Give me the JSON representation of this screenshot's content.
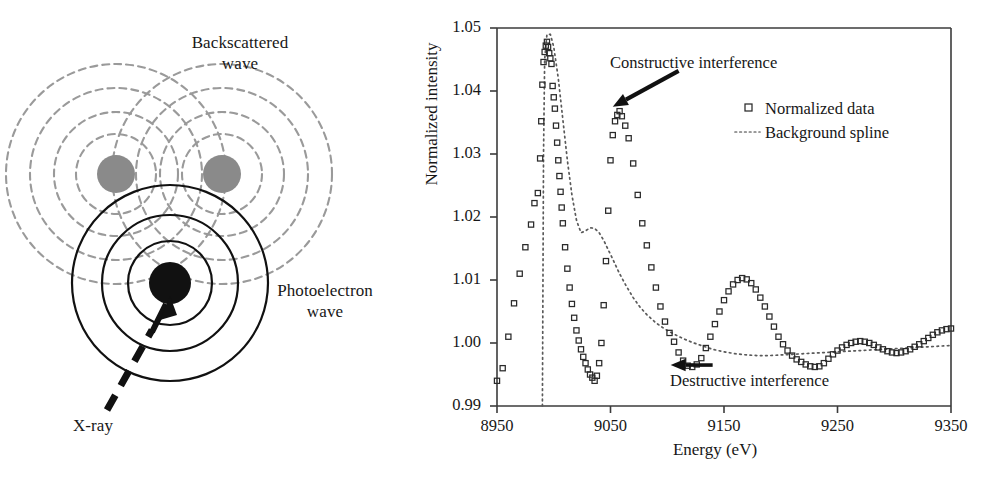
{
  "figure": {
    "diagram": {
      "labels": {
        "backscattered": "Backscattered\nwave",
        "backscattered_line1": "Backscattered",
        "backscattered_line2": "wave",
        "photoelectron_line1": "Photoelectron",
        "photoelectron_line2": "wave",
        "xray": "X-ray"
      },
      "colors": {
        "absorber_atom": "#111111",
        "scatterer_atom": "#8a8a8a",
        "photoelectron_wave": "#111111",
        "backscattered_wave": "#9a9a9a",
        "xray_arrow": "#111111"
      },
      "elements": {
        "absorber_atom_name": "absorbing-atom",
        "scatterer_left_name": "neighbor-atom-left",
        "scatterer_right_name": "neighbor-atom-right"
      }
    },
    "chart_data": {
      "type": "scatter",
      "title": "",
      "xlabel": "Energy (eV)",
      "ylabel": "Normalized intensity",
      "xlim": [
        8950,
        9350
      ],
      "ylim": [
        0.99,
        1.05
      ],
      "xticks": [
        8950,
        9050,
        9150,
        9250,
        9350
      ],
      "xtick_labels": [
        "8950",
        "9050",
        "9150",
        "9250",
        "9350"
      ],
      "yticks": [
        0.99,
        1.0,
        1.01,
        1.02,
        1.03,
        1.04,
        1.05
      ],
      "ytick_labels": [
        "0.99",
        "1.00",
        "1.01",
        "1.02",
        "1.03",
        "1.04",
        "1.05"
      ],
      "grid": false,
      "legend_position": "upper right",
      "legend": [
        {
          "label": "Normalized data",
          "marker": "square-open",
          "style": "markers"
        },
        {
          "label": "Background spline",
          "marker": "none",
          "style": "dotted-line"
        }
      ],
      "annotations": [
        {
          "text": "Constructive interference",
          "arrow_to_x": 9052,
          "arrow_to_y": 1.0375,
          "arrow_from_x": 9110,
          "arrow_from_y": 1.0432
        },
        {
          "text": "Destructive interference",
          "arrow_to_x": 9103,
          "arrow_to_y": 0.9965,
          "arrow_from_x": 9140,
          "arrow_from_y": 0.9965
        }
      ],
      "series": [
        {
          "name": "Normalized data",
          "marker": "square-open",
          "x": [
            8950,
            8955,
            8960,
            8965,
            8970,
            8975,
            8980,
            8983,
            8986,
            8988,
            8989,
            8990,
            8991,
            8992,
            8993,
            8994,
            8995,
            8996,
            8997,
            8998,
            8999,
            9000,
            9001,
            9002,
            9003,
            9004,
            9005,
            9006,
            9007,
            9008,
            9010,
            9012,
            9014,
            9016,
            9018,
            9020,
            9022,
            9024,
            9026,
            9028,
            9030,
            9032,
            9034,
            9036,
            9038,
            9040,
            9042,
            9044,
            9046,
            9048,
            9050,
            9052,
            9054,
            9056,
            9058,
            9060,
            9063,
            9066,
            9070,
            9074,
            9078,
            9082,
            9086,
            9090,
            9094,
            9098,
            9102,
            9106,
            9110,
            9114,
            9118,
            9122,
            9126,
            9130,
            9134,
            9138,
            9142,
            9146,
            9150,
            9154,
            9158,
            9162,
            9166,
            9170,
            9174,
            9178,
            9182,
            9186,
            9190,
            9194,
            9198,
            9202,
            9206,
            9210,
            9214,
            9218,
            9222,
            9226,
            9230,
            9234,
            9238,
            9242,
            9246,
            9250,
            9254,
            9258,
            9262,
            9266,
            9270,
            9274,
            9278,
            9282,
            9286,
            9290,
            9294,
            9298,
            9302,
            9306,
            9310,
            9314,
            9318,
            9322,
            9326,
            9330,
            9334,
            9338,
            9342,
            9346,
            9350
          ],
          "y": [
            0.994,
            0.996,
            1.001,
            1.0063,
            1.011,
            1.0152,
            1.0188,
            1.0222,
            1.0238,
            1.0293,
            1.0352,
            1.041,
            1.0446,
            1.0462,
            1.0472,
            1.0478,
            1.047,
            1.046,
            1.0452,
            1.0443,
            1.0408,
            1.039,
            1.0372,
            1.0345,
            1.0318,
            1.029,
            1.0265,
            1.024,
            1.0215,
            1.019,
            1.0152,
            1.0118,
            1.0088,
            1.0062,
            1.004,
            1.002,
            1.0004,
            0.999,
            0.9978,
            0.9968,
            0.9958,
            0.995,
            0.9945,
            0.994,
            0.9948,
            0.9968,
            1.0,
            1.006,
            1.013,
            1.021,
            1.029,
            1.033,
            1.0352,
            1.0362,
            1.0368,
            1.036,
            1.0345,
            1.0325,
            1.0285,
            1.0235,
            1.019,
            1.0155,
            1.012,
            1.0088,
            1.0058,
            1.0034,
            1.0016,
            1.0002,
            0.9985,
            0.9972,
            0.9964,
            0.9962,
            0.9966,
            0.9976,
            0.9992,
            1.001,
            1.003,
            1.005,
            1.0068,
            1.0082,
            1.0093,
            1.01,
            1.0103,
            1.0101,
            1.0095,
            1.0085,
            1.0072,
            1.0058,
            1.0042,
            1.0026,
            1.001,
            0.9998,
            0.9988,
            0.998,
            0.9974,
            0.997,
            0.9966,
            0.9963,
            0.9962,
            0.9963,
            0.9968,
            0.9975,
            0.9982,
            0.9988,
            0.9993,
            0.9997,
            1.0,
            1.0002,
            1.0003,
            1.0002,
            1.0,
            0.9997,
            0.9993,
            0.999,
            0.9987,
            0.9985,
            0.9984,
            0.9985,
            0.9987,
            0.999,
            0.9994,
            0.9998,
            1.0003,
            1.0008,
            1.0013,
            1.0017,
            1.002,
            1.0022,
            1.0023
          ]
        },
        {
          "name": "Background spline",
          "style": "dotted-line",
          "x": [
            8990,
            8990.5,
            8991,
            8992,
            8994,
            8997,
            9000,
            9004,
            9008,
            9012,
            9016,
            9020,
            9024,
            9028,
            9032,
            9036,
            9040,
            9044,
            9048,
            9052,
            9058,
            9064,
            9070,
            9076,
            9082,
            9090,
            9098,
            9106,
            9114,
            9122,
            9130,
            9140,
            9150,
            9160,
            9170,
            9180,
            9190,
            9200,
            9210,
            9220,
            9230,
            9240,
            9250,
            9260,
            9270,
            9280,
            9290,
            9300,
            9310,
            9320,
            9330,
            9340,
            9350
          ],
          "y": [
            0.99,
            1.01,
            1.03,
            1.045,
            1.049,
            1.049,
            1.047,
            1.042,
            1.0355,
            1.029,
            1.0235,
            1.0195,
            1.0175,
            1.0178,
            1.0183,
            1.0182,
            1.0175,
            1.0163,
            1.0148,
            1.0133,
            1.011,
            1.009,
            1.0072,
            1.0057,
            1.0045,
            1.0032,
            1.0022,
            1.0014,
            1.0007,
            1.0001,
            0.9996,
            0.999,
            0.9986,
            0.9983,
            0.9981,
            0.998,
            0.998,
            0.9981,
            0.9982,
            0.9983,
            0.9984,
            0.9985,
            0.9986,
            0.9987,
            0.9988,
            0.9989,
            0.999,
            0.9991,
            0.9992,
            0.9993,
            0.9994,
            0.9995,
            0.9996
          ]
        }
      ]
    }
  }
}
